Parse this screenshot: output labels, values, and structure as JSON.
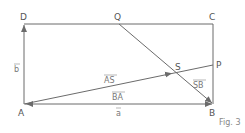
{
  "diagram": {
    "caption": "Fig. 3",
    "colors": {
      "stroke": "#6b6b6b",
      "text": "#555555"
    },
    "points": {
      "A": {
        "label": "A",
        "x": 24,
        "y": 104
      },
      "B": {
        "label": "B",
        "x": 213,
        "y": 104
      },
      "C": {
        "label": "C",
        "x": 213,
        "y": 24
      },
      "D": {
        "label": "D",
        "x": 24,
        "y": 24
      },
      "Q": {
        "label": "Q",
        "x": 119,
        "y": 24
      },
      "P": {
        "label": "P",
        "x": 213,
        "y": 65
      },
      "S": {
        "label": "S",
        "x": 173,
        "y": 73
      }
    },
    "vector_labels": {
      "b": "b",
      "a": "a",
      "AS": "AS",
      "BA": "BA",
      "SB": "SB"
    }
  }
}
